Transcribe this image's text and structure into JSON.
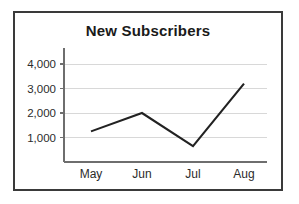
{
  "chart_data": {
    "type": "line",
    "title": "New Subscribers",
    "xlabel": "",
    "ylabel": "",
    "categories": [
      "May",
      "Jun",
      "Jul",
      "Aug"
    ],
    "series": [
      {
        "name": "New Subscribers",
        "values": [
          1250,
          2000,
          650,
          3200
        ],
        "color": "#222222"
      }
    ],
    "ylim": [
      0,
      4600
    ],
    "ytick_values": [
      1000,
      2000,
      3000,
      4000
    ],
    "ytick_labels": [
      "1,000",
      "2,000",
      "3,000",
      "4,000"
    ],
    "grid": "horizontal",
    "legend": "none",
    "colors": {
      "line": "#222222",
      "gridline": "#d8d8d8",
      "axis": "#6e6e6e",
      "border": "#3a3a3a",
      "text": "#2b2b2b",
      "title": "#1a1a1a",
      "background": "#ffffff"
    }
  }
}
